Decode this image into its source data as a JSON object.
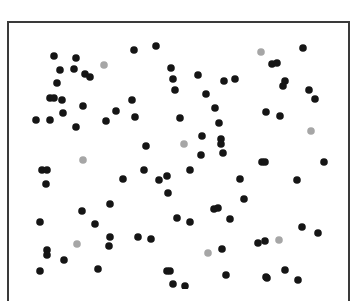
{
  "figure": {
    "colors": {
      "black_dot": "#151515",
      "gray_dot": "#a6a6a6",
      "border": "#3a3a3a",
      "background": "#ffffff"
    },
    "dot_radius": 3.8
  },
  "chart_data": {
    "type": "scatter",
    "title": "",
    "xlabel": "",
    "ylabel": "",
    "grid": false,
    "series": [
      {
        "name": "black",
        "color": "#151515",
        "points": [
          [
            54,
            56
          ],
          [
            76,
            58
          ],
          [
            60,
            70
          ],
          [
            74,
            69
          ],
          [
            85,
            74
          ],
          [
            90,
            77
          ],
          [
            57,
            83
          ],
          [
            50,
            98
          ],
          [
            54,
            98
          ],
          [
            62,
            100
          ],
          [
            83,
            106
          ],
          [
            63,
            113
          ],
          [
            36,
            120
          ],
          [
            50,
            120
          ],
          [
            76,
            127
          ],
          [
            134,
            50
          ],
          [
            156,
            46
          ],
          [
            171,
            68
          ],
          [
            173,
            79
          ],
          [
            175,
            90
          ],
          [
            198,
            75
          ],
          [
            206,
            94
          ],
          [
            132,
            100
          ],
          [
            116,
            111
          ],
          [
            135,
            117
          ],
          [
            106,
            121
          ],
          [
            180,
            118
          ],
          [
            215,
            108
          ],
          [
            219,
            123
          ],
          [
            303,
            48
          ],
          [
            272,
            64
          ],
          [
            277,
            63
          ],
          [
            224,
            81
          ],
          [
            235,
            79
          ],
          [
            285,
            81
          ],
          [
            283,
            86
          ],
          [
            309,
            90
          ],
          [
            315,
            99
          ],
          [
            266,
            112
          ],
          [
            280,
            116
          ],
          [
            146,
            146
          ],
          [
            42,
            170
          ],
          [
            47,
            170
          ],
          [
            46,
            184
          ],
          [
            123,
            179
          ],
          [
            144,
            170
          ],
          [
            202,
            136
          ],
          [
            221,
            139
          ],
          [
            221,
            144
          ],
          [
            201,
            155
          ],
          [
            223,
            153
          ],
          [
            159,
            180
          ],
          [
            167,
            176
          ],
          [
            190,
            170
          ],
          [
            168,
            193
          ],
          [
            240,
            179
          ],
          [
            244,
            199
          ],
          [
            214,
            209
          ],
          [
            218,
            208
          ],
          [
            262,
            162
          ],
          [
            265,
            162
          ],
          [
            324,
            162
          ],
          [
            297,
            180
          ],
          [
            302,
            227
          ],
          [
            110,
            204
          ],
          [
            82,
            211
          ],
          [
            40,
            222
          ],
          [
            95,
            224
          ],
          [
            110,
            237
          ],
          [
            109,
            246
          ],
          [
            47,
            250
          ],
          [
            47,
            255
          ],
          [
            64,
            260
          ],
          [
            40,
            271
          ],
          [
            98,
            269
          ],
          [
            138,
            237
          ],
          [
            151,
            239
          ],
          [
            177,
            218
          ],
          [
            190,
            222
          ],
          [
            230,
            219
          ],
          [
            258,
            243
          ],
          [
            222,
            249
          ],
          [
            167,
            271
          ],
          [
            170,
            271
          ],
          [
            173,
            284
          ],
          [
            185,
            286
          ],
          [
            226,
            275
          ],
          [
            266,
            277
          ],
          [
            318,
            233
          ],
          [
            265,
            241
          ],
          [
            285,
            270
          ],
          [
            267,
            278
          ],
          [
            298,
            280
          ]
        ]
      },
      {
        "name": "gray",
        "color": "#a6a6a6",
        "points": [
          [
            104,
            65
          ],
          [
            261,
            52
          ],
          [
            311,
            131
          ],
          [
            83,
            160
          ],
          [
            184,
            144
          ],
          [
            77,
            244
          ],
          [
            208,
            253
          ],
          [
            279,
            240
          ]
        ]
      }
    ]
  }
}
